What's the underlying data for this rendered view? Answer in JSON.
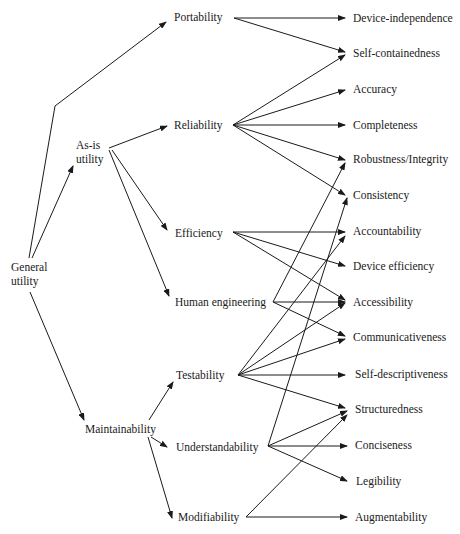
{
  "diagram": {
    "type": "tree",
    "nodes": {
      "general_utility": "General\nutility",
      "as_is_utility": "As-is\nutility",
      "portability": "Portability",
      "reliability": "Reliability",
      "efficiency": "Efficiency",
      "human_engineering": "Human engineering",
      "maintainability": "Maintainability",
      "testability": "Testability",
      "understandability": "Understandability",
      "modifiability": "Modifiability",
      "device_independence": "Device-independence",
      "self_containedness": "Self-containedness",
      "accuracy": "Accuracy",
      "completeness": "Completeness",
      "robustness_integrity": "Robustness/Integrity",
      "consistency": "Consistency",
      "accountability": "Accountability",
      "device_efficiency": "Device efficiency",
      "accessibility": "Accessibility",
      "communicativeness": "Communicativeness",
      "self_descriptiveness": "Self-descriptiveness",
      "structuredness": "Structuredness",
      "conciseness": "Conciseness",
      "legibility": "Legibility",
      "augmentability": "Augmentability"
    },
    "edges": [
      [
        "General utility",
        "Portability"
      ],
      [
        "General utility",
        "As-is utility"
      ],
      [
        "General utility",
        "Maintainability"
      ],
      [
        "As-is utility",
        "Reliability"
      ],
      [
        "As-is utility",
        "Efficiency"
      ],
      [
        "As-is utility",
        "Human engineering"
      ],
      [
        "Maintainability",
        "Testability"
      ],
      [
        "Maintainability",
        "Understandability"
      ],
      [
        "Maintainability",
        "Modifiability"
      ],
      [
        "Portability",
        "Device-independence"
      ],
      [
        "Portability",
        "Self-containedness"
      ],
      [
        "Reliability",
        "Self-containedness"
      ],
      [
        "Reliability",
        "Accuracy"
      ],
      [
        "Reliability",
        "Completeness"
      ],
      [
        "Reliability",
        "Robustness/Integrity"
      ],
      [
        "Reliability",
        "Consistency"
      ],
      [
        "Efficiency",
        "Accountability"
      ],
      [
        "Efficiency",
        "Device efficiency"
      ],
      [
        "Efficiency",
        "Accessibility"
      ],
      [
        "Human engineering",
        "Robustness/Integrity"
      ],
      [
        "Human engineering",
        "Accessibility"
      ],
      [
        "Human engineering",
        "Communicativeness"
      ],
      [
        "Testability",
        "Accountability"
      ],
      [
        "Testability",
        "Accessibility"
      ],
      [
        "Testability",
        "Communicativeness"
      ],
      [
        "Testability",
        "Self-descriptiveness"
      ],
      [
        "Testability",
        "Structuredness"
      ],
      [
        "Understandability",
        "Consistency"
      ],
      [
        "Understandability",
        "Structuredness"
      ],
      [
        "Understandability",
        "Conciseness"
      ],
      [
        "Understandability",
        "Legibility"
      ],
      [
        "Modifiability",
        "Structuredness"
      ],
      [
        "Modifiability",
        "Augmentability"
      ]
    ]
  }
}
